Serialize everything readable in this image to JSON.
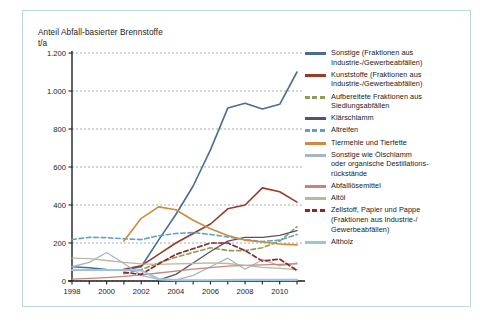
{
  "figure": {
    "border_color": "#bcd7e8",
    "background": "#ffffff"
  },
  "chart_data": {
    "type": "line",
    "title": "Anteil Abfall-basierter Brennstoffe",
    "ylabel": "t/a",
    "xlabel": "",
    "ylim": [
      0,
      1200
    ],
    "y_ticks": [
      "0",
      "200",
      "400",
      "600",
      "800",
      "1.000",
      "1.200"
    ],
    "y_tick_values": [
      0,
      200,
      400,
      600,
      800,
      1000,
      1200
    ],
    "x": [
      1998,
      1999,
      2000,
      2001,
      2002,
      2003,
      2004,
      2005,
      2006,
      2007,
      2008,
      2009,
      2010,
      2011
    ],
    "xlim": [
      1998,
      2011
    ],
    "x_ticks": [
      "1998",
      "2000",
      "2002",
      "2004",
      "2006",
      "2008",
      "2010"
    ],
    "x_tick_values": [
      1998,
      2000,
      2002,
      2004,
      2006,
      2008,
      2010
    ],
    "grid": true,
    "grid_style": "dashed-horizontal",
    "legend_position": "right",
    "series": [
      {
        "name": "Sonstige (Fraktionen aus Industrie-/Gewerbeabfällen)",
        "color": "#4a6c96",
        "style": "solid",
        "width": 1.6,
        "values": [
          75,
          70,
          60,
          58,
          75,
          215,
          350,
          500,
          690,
          910,
          935,
          905,
          930,
          1100
        ]
      },
      {
        "name": "Kunststoffe (Fraktionen aus Industrie-/Gewerbeabfällen)",
        "color": "#963c28",
        "style": "solid",
        "width": 1.6,
        "values": [
          null,
          null,
          null,
          62,
          80,
          140,
          200,
          250,
          300,
          380,
          400,
          490,
          470,
          415
        ]
      },
      {
        "name": "Aufbereitete Fraktionen aus Siedlungsabfällen",
        "color": "#8ca05a",
        "style": "dashed",
        "width": 1.6,
        "values": [
          null,
          null,
          null,
          38,
          60,
          95,
          125,
          150,
          175,
          160,
          160,
          175,
          210,
          285
        ]
      },
      {
        "name": "Klärschlamm",
        "color": "#5c4e6e",
        "style": "solid",
        "width": 1.3,
        "values": [
          null,
          null,
          null,
          null,
          null,
          5,
          35,
          95,
          155,
          210,
          230,
          230,
          240,
          265
        ]
      },
      {
        "name": "Altreifen",
        "color": "#5ba3c4",
        "style": "dashed",
        "width": 1.6,
        "values": [
          218,
          230,
          228,
          222,
          218,
          238,
          250,
          255,
          245,
          232,
          218,
          208,
          215,
          245
        ]
      },
      {
        "name": "Tiermehle und Tierfette",
        "color": "#d08a3c",
        "style": "solid",
        "width": 1.6,
        "values": [
          null,
          null,
          null,
          210,
          330,
          390,
          375,
          320,
          275,
          240,
          215,
          205,
          195,
          190
        ]
      },
      {
        "name": "Sonstige wie Ölschlamm oder organische Destillationsrückstände",
        "color": "#a8b4c8",
        "style": "solid",
        "width": 1.3,
        "values": [
          75,
          98,
          150,
          92,
          30,
          8,
          5,
          30,
          75,
          120,
          62,
          112,
          80,
          95
        ]
      },
      {
        "name": "Abfalllösemittel",
        "color": "#c08878",
        "style": "solid",
        "width": 1.3,
        "values": [
          10,
          14,
          18,
          24,
          32,
          42,
          52,
          62,
          70,
          78,
          82,
          85,
          88,
          90
        ]
      },
      {
        "name": "Altöl",
        "color": "#b4bc9c",
        "style": "solid",
        "width": 1.3,
        "values": [
          120,
          118,
          108,
          98,
          90,
          88,
          90,
          92,
          95,
          92,
          82,
          72,
          66,
          60
        ]
      },
      {
        "name": "Zellstoff, Papier und Pappe (Fraktionen aus Industrie-/Gewerbeabfällen)",
        "color": "#8c2828",
        "style": "dashed",
        "width": 1.7,
        "values": [
          null,
          null,
          null,
          45,
          35,
          90,
          140,
          170,
          200,
          200,
          160,
          105,
          115,
          55
        ]
      },
      {
        "name": "Altholz",
        "color": "#9cc4dc",
        "style": "solid",
        "width": 2.2,
        "values": [
          58,
          58,
          58,
          58,
          56,
          10,
          5,
          4,
          4,
          5,
          6,
          6,
          6,
          6
        ]
      }
    ]
  },
  "legend": {
    "items": [
      {
        "label_lines": [
          "Sonstige (Fraktionen aus",
          "Industrie-/Gewerbeabfällen)"
        ],
        "color": "#4a6c96",
        "style": "solid"
      },
      {
        "label_lines": [
          "Kunststoffe (Fraktionen aus",
          "Industrie-/Gewerbeabfällen)"
        ],
        "color": "#963c28",
        "style": "solid"
      },
      {
        "label_lines": [
          "Aufbereitete Fraktionen aus",
          "Siedlungsabfällen"
        ],
        "color": "#8ca05a",
        "style": "dashed"
      },
      {
        "label_lines": [
          "Klärschlamm"
        ],
        "color": "#5c4e6e",
        "style": "solid"
      },
      {
        "label_lines": [
          "Altreifen"
        ],
        "color": "#5ba3c4",
        "style": "dashed"
      },
      {
        "label_lines": [
          "Tiermehle und Tierfette"
        ],
        "color": "#d08a3c",
        "style": "solid"
      },
      {
        "label_lines": [
          "Sonstige wie Ölschlamm",
          "oder organische Destillations-",
          "rückstände"
        ],
        "color": "#a8b4c8",
        "style": "solid"
      },
      {
        "label_lines": [
          "Abfalllösemittel"
        ],
        "color": "#c08878",
        "style": "solid"
      },
      {
        "label_lines": [
          "Altöl"
        ],
        "color": "#b4bc9c",
        "style": "solid"
      },
      {
        "label_lines": [
          "Zellstoff, Papier und Pappe",
          "(Fraktionen aus Industrie-/",
          "Gewerbeabfällen)"
        ],
        "color": "#8c2828",
        "style": "dashed"
      },
      {
        "label_lines": [
          "Altholz"
        ],
        "color": "#9cc4dc",
        "style": "solid"
      }
    ]
  }
}
